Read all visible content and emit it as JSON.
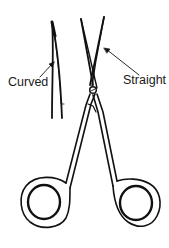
{
  "diagram": {
    "labels": {
      "curved": "Curved",
      "straight": "Straight"
    },
    "colors": {
      "line": "#111111",
      "background": "#ffffff"
    }
  }
}
